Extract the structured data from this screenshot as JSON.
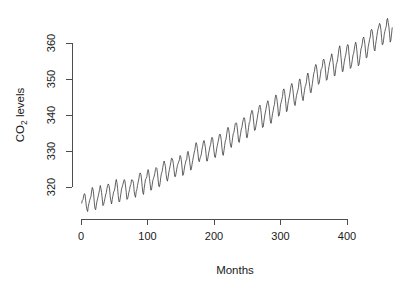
{
  "chart_data": {
    "type": "line",
    "title": "",
    "subtitle": "",
    "xlabel": "Months",
    "ylabel_text": "CO",
    "ylabel_sub": "2",
    "ylabel_tail": " levels",
    "ylabel_plain": "CO2 levels",
    "xlim": [
      0,
      468
    ],
    "ylim": [
      312.5,
      368
    ],
    "xticks": [
      0,
      100,
      200,
      300,
      400
    ],
    "yticks": [
      320,
      330,
      340,
      350,
      360
    ],
    "xtick_labels": [
      "0",
      "100",
      "200",
      "300",
      "400"
    ],
    "ytick_labels": [
      "320",
      "330",
      "340",
      "350",
      "360"
    ],
    "grid": false,
    "legend": null,
    "series_name": "Atmospheric CO2 concentration (ppm)",
    "line_color": "#3a3a3a",
    "axis_color": "#4d4d4d",
    "background_color": "#ffffff",
    "n_points": 468,
    "x_start": 1,
    "x_step": 1,
    "values": [
      315.42,
      316.31,
      316.5,
      317.56,
      318.13,
      318.0,
      316.39,
      314.65,
      313.68,
      313.18,
      314.66,
      315.43,
      316.27,
      316.81,
      317.42,
      318.87,
      319.87,
      319.43,
      318.01,
      315.74,
      314.0,
      313.68,
      314.84,
      316.03,
      316.73,
      317.54,
      318.38,
      319.31,
      320.42,
      319.61,
      318.42,
      316.63,
      314.83,
      315.16,
      315.94,
      316.85,
      317.78,
      318.4,
      319.53,
      320.42,
      320.85,
      320.45,
      319.45,
      317.25,
      316.11,
      315.27,
      316.53,
      317.53,
      318.58,
      318.92,
      319.7,
      321.22,
      322.08,
      321.31,
      319.58,
      317.61,
      316.05,
      315.83,
      316.91,
      318.2,
      319.41,
      320.07,
      320.74,
      321.4,
      322.06,
      321.73,
      320.27,
      318.54,
      316.54,
      316.71,
      317.53,
      318.55,
      319.27,
      320.28,
      320.73,
      321.97,
      322.0,
      321.71,
      321.05,
      318.71,
      317.66,
      317.14,
      318.7,
      319.25,
      320.46,
      321.43,
      322.23,
      323.54,
      323.91,
      323.59,
      322.24,
      320.2,
      318.48,
      317.94,
      319.63,
      320.87,
      322.17,
      322.34,
      322.88,
      324.25,
      324.83,
      323.93,
      322.38,
      320.76,
      319.1,
      319.24,
      320.56,
      321.8,
      322.4,
      322.99,
      323.73,
      324.86,
      325.4,
      325.2,
      323.98,
      321.95,
      320.18,
      320.09,
      321.16,
      322.74,
      323.83,
      324.26,
      325.47,
      326.5,
      327.21,
      326.54,
      325.72,
      323.5,
      322.22,
      321.62,
      322.69,
      323.95,
      324.89,
      325.82,
      326.77,
      327.97,
      327.91,
      327.5,
      326.18,
      324.53,
      322.93,
      322.9,
      323.85,
      324.96,
      326.01,
      326.51,
      327.01,
      327.62,
      328.76,
      328.4,
      327.2,
      325.27,
      323.2,
      323.4,
      324.63,
      325.85,
      326.6,
      327.47,
      327.58,
      329.56,
      329.9,
      328.92,
      327.88,
      326.16,
      324.68,
      325.04,
      326.34,
      327.39,
      328.37,
      329.4,
      330.14,
      331.33,
      332.31,
      331.9,
      330.7,
      329.15,
      327.35,
      327.02,
      327.99,
      328.48,
      329.18,
      330.55,
      331.32,
      332.48,
      332.92,
      332.08,
      331.01,
      329.23,
      327.27,
      327.21,
      328.29,
      329.41,
      330.23,
      331.25,
      331.87,
      333.14,
      333.8,
      333.43,
      331.73,
      329.9,
      328.4,
      328.17,
      329.32,
      330.59,
      331.58,
      332.39,
      333.33,
      334.41,
      334.71,
      334.17,
      332.89,
      330.77,
      329.14,
      328.78,
      330.14,
      331.52,
      332.75,
      333.24,
      334.53,
      335.9,
      336.57,
      336.1,
      334.76,
      332.59,
      331.42,
      330.98,
      332.24,
      333.68,
      334.8,
      335.22,
      336.47,
      337.59,
      337.84,
      337.72,
      336.37,
      334.51,
      332.6,
      332.38,
      333.75,
      334.78,
      336.05,
      336.59,
      337.79,
      338.71,
      339.3,
      339.12,
      337.56,
      335.92,
      333.75,
      333.7,
      335.12,
      336.56,
      337.84,
      338.19,
      339.91,
      340.6,
      341.29,
      341.0,
      339.39,
      337.43,
      335.72,
      335.84,
      336.93,
      338.04,
      339.06,
      340.3,
      341.21,
      342.33,
      342.74,
      342.08,
      340.32,
      338.26,
      336.52,
      336.68,
      338.19,
      339.44,
      340.57,
      341.44,
      342.53,
      343.39,
      343.96,
      343.18,
      341.88,
      339.65,
      337.81,
      337.69,
      339.09,
      340.32,
      341.2,
      342.35,
      342.93,
      344.77,
      345.58,
      345.14,
      343.81,
      342.21,
      339.69,
      339.82,
      340.98,
      342.82,
      343.52,
      344.33,
      345.11,
      346.88,
      347.25,
      346.62,
      345.22,
      343.11,
      340.9,
      341.18,
      342.8,
      344.04,
      344.79,
      345.82,
      347.25,
      348.17,
      348.74,
      348.07,
      346.38,
      344.51,
      342.92,
      342.62,
      344.06,
      345.38,
      346.11,
      346.78,
      347.68,
      349.37,
      350.03,
      349.37,
      347.76,
      345.73,
      344.68,
      343.99,
      345.48,
      346.72,
      347.84,
      348.29,
      349.23,
      350.8,
      351.66,
      351.07,
      349.33,
      347.92,
      346.27,
      346.18,
      347.64,
      348.78,
      350.25,
      351.54,
      352.05,
      353.41,
      354.04,
      353.62,
      352.22,
      350.27,
      348.55,
      348.72,
      349.91,
      351.18,
      352.6,
      352.92,
      353.53,
      355.26,
      355.52,
      354.97,
      353.75,
      351.52,
      349.64,
      349.83,
      351.14,
      352.37,
      353.5,
      354.55,
      355.23,
      356.04,
      357.0,
      356.07,
      354.67,
      352.76,
      350.82,
      351.04,
      352.69,
      354.07,
      354.59,
      355.63,
      357.03,
      358.48,
      359.22,
      358.12,
      356.06,
      353.92,
      352.05,
      352.11,
      353.64,
      354.89,
      355.88,
      356.63,
      357.72,
      359.07,
      359.58,
      359.17,
      356.94,
      354.92,
      352.94,
      353.23,
      354.09,
      355.33,
      356.63,
      357.1,
      358.32,
      359.41,
      360.23,
      359.55,
      357.53,
      355.48,
      353.67,
      353.95,
      355.3,
      356.78,
      358.34,
      358.89,
      359.95,
      361.25,
      361.67,
      360.94,
      359.55,
      357.49,
      355.84,
      356.0,
      357.59,
      359.05,
      359.98,
      361.03,
      361.66,
      363.48,
      363.82,
      363.3,
      361.94,
      359.5,
      358.11,
      357.8,
      359.61,
      360.74,
      362.09,
      363.29,
      364.06,
      364.76,
      365.45,
      365.01,
      363.7,
      361.54,
      359.51,
      359.65,
      360.8,
      362.38,
      363.23,
      364.06,
      364.61,
      366.4,
      366.84,
      365.68,
      364.52,
      362.57,
      360.24,
      360.83,
      362.49,
      364.34
    ]
  },
  "plot_geometry": {
    "x_axis_pixel_left": 81,
    "x_axis_pixel_right": 347,
    "y_axis_pixel_top": 43,
    "y_axis_pixel_bottom": 187
  }
}
